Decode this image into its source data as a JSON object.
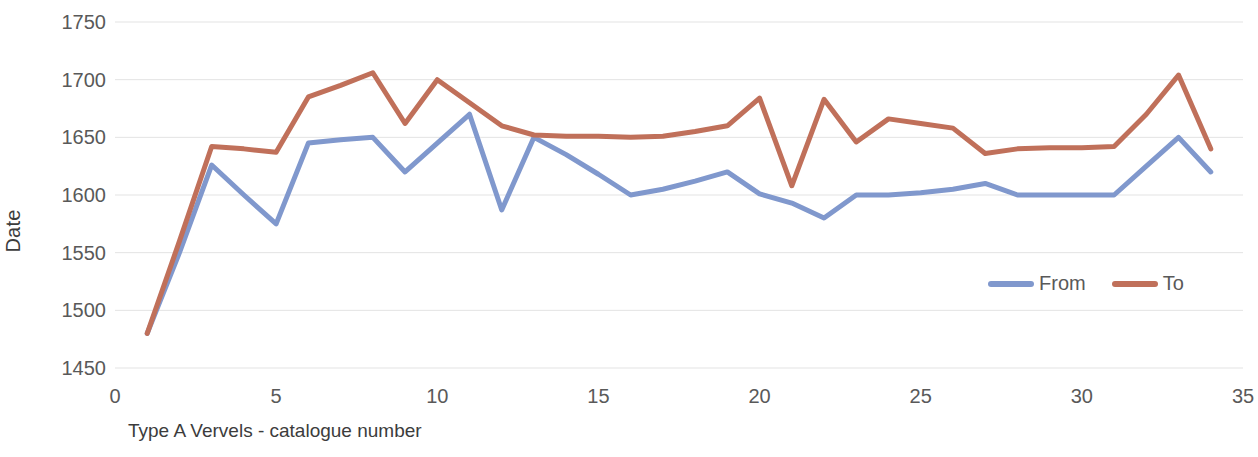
{
  "chart_data": {
    "type": "line",
    "title": "",
    "xlabel": "Type A Vervels - catalogue number",
    "ylabel": "Date",
    "xlim": [
      0,
      35
    ],
    "ylim": [
      1450,
      1750
    ],
    "xticks": [
      0,
      5,
      10,
      15,
      20,
      25,
      30,
      35
    ],
    "yticks": [
      1450,
      1500,
      1550,
      1600,
      1650,
      1700,
      1750
    ],
    "grid": true,
    "legend_position": "inside-right",
    "x": [
      1,
      2,
      3,
      4,
      5,
      6,
      7,
      8,
      9,
      10,
      11,
      12,
      13,
      14,
      15,
      16,
      17,
      18,
      19,
      20,
      21,
      22,
      23,
      24,
      25,
      26,
      27,
      28,
      29,
      30,
      31,
      32,
      33,
      34
    ],
    "series": [
      {
        "name": "From",
        "color": "#8098CD",
        "values": [
          1480,
          1550,
          1626,
          1600,
          1575,
          1645,
          1648,
          1650,
          1620,
          1645,
          1670,
          1587,
          1650,
          1635,
          1618,
          1600,
          1605,
          1612,
          1620,
          1601,
          1593,
          1580,
          1600,
          1600,
          1602,
          1605,
          1610,
          1600,
          1600,
          1600,
          1600,
          1625,
          1650,
          1620
        ]
      },
      {
        "name": "To",
        "color": "#C0705A",
        "values": [
          1480,
          1560,
          1642,
          1640,
          1637,
          1685,
          1695,
          1706,
          1662,
          1700,
          1680,
          1660,
          1652,
          1651,
          1651,
          1650,
          1651,
          1655,
          1660,
          1684,
          1608,
          1683,
          1646,
          1666,
          1662,
          1658,
          1636,
          1640,
          1641,
          1641,
          1642,
          1670,
          1704,
          1640
        ]
      }
    ]
  },
  "legend": {
    "items": [
      {
        "label": "From",
        "color": "#8098CD"
      },
      {
        "label": "To",
        "color": "#C0705A"
      }
    ]
  },
  "axes": {
    "y_title": "Date",
    "x_title": "Type A Vervels - catalogue number"
  }
}
